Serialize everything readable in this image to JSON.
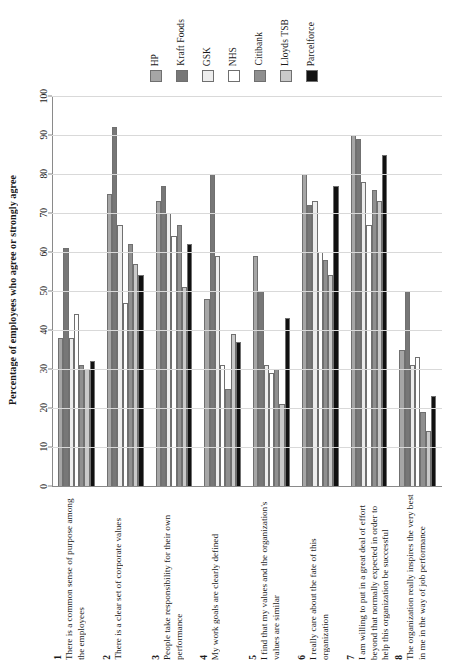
{
  "legend": {
    "position": "top",
    "entries": [
      {
        "label": "HP",
        "color": "#a6a6a6"
      },
      {
        "label": "Kraft Foods",
        "color": "#777777"
      },
      {
        "label": "GSK",
        "color": "#ededed"
      },
      {
        "label": "NHS",
        "color": "#ffffff"
      },
      {
        "label": "Citibank",
        "color": "#8f8f8f"
      },
      {
        "label": "Lloyds TSB",
        "color": "#c9c9c9"
      },
      {
        "label": "Parcelforce",
        "color": "#111111"
      }
    ]
  },
  "axis": {
    "ylabel": "Percentage of employees who agree or strongly agree",
    "yticks": [
      0,
      10,
      20,
      30,
      40,
      50,
      60,
      70,
      80,
      90,
      100
    ],
    "ymin": 0,
    "ymax": 100
  },
  "categories_numbered": [
    {
      "num": "1",
      "text": "There is a common sense of purpose among the employees"
    },
    {
      "num": "2",
      "text": "There is a clear set of corporate values"
    },
    {
      "num": "3",
      "text": "People  take responsibility for their own performance"
    },
    {
      "num": "4",
      "text": "My work goals are clearly defined"
    },
    {
      "num": "5",
      "text": "I find that my values and the organization's values are similar"
    },
    {
      "num": "6",
      "text": "I really care about the fate of this organization"
    },
    {
      "num": "7",
      "text": "I am willing to put in a great deal of effort beyond that normally expected in order to help this organization be successful"
    },
    {
      "num": "8",
      "text": "The organization really inspires the very best in me in the way of job performance"
    }
  ],
  "chart_data": {
    "type": "bar",
    "title": "",
    "xlabel": "",
    "ylabel": "Percentage of employees who agree or strongly agree",
    "ylim": [
      0,
      100
    ],
    "grid": true,
    "legend_position": "top",
    "categories": [
      "There is a common sense of purpose among the employees",
      "There is a clear set of corporate values",
      "People  take responsibility for their own performance",
      "My work goals are clearly defined",
      "I find that my values and the organization's values are similar",
      "I really care about the fate of this organization",
      "I am willing to put in a great deal of effort beyond that normally expected in order to help this organization be successful",
      "The organization really inspires the very best in me in the way of job performance"
    ],
    "series": [
      {
        "name": "HP",
        "color": "#a6a6a6",
        "values": [
          38,
          75,
          73,
          48,
          59,
          80,
          90,
          35
        ]
      },
      {
        "name": "Kraft Foods",
        "color": "#777777",
        "values": [
          61,
          92,
          77,
          80,
          50,
          72,
          89,
          50
        ]
      },
      {
        "name": "GSK",
        "color": "#ededed",
        "values": [
          38,
          67,
          70,
          59,
          31,
          73,
          78,
          31
        ]
      },
      {
        "name": "NHS",
        "color": "#ffffff",
        "values": [
          44,
          47,
          64,
          31,
          29,
          60,
          67,
          33
        ]
      },
      {
        "name": "Citibank",
        "color": "#8f8f8f",
        "values": [
          31,
          62,
          67,
          25,
          30,
          58,
          76,
          19
        ]
      },
      {
        "name": "Lloyds TSB",
        "color": "#c9c9c9",
        "values": [
          30,
          57,
          51,
          39,
          21,
          54,
          73,
          14
        ]
      },
      {
        "name": "Parcelforce",
        "color": "#111111",
        "values": [
          32,
          54,
          62,
          37,
          43,
          77,
          85,
          23
        ]
      }
    ]
  }
}
